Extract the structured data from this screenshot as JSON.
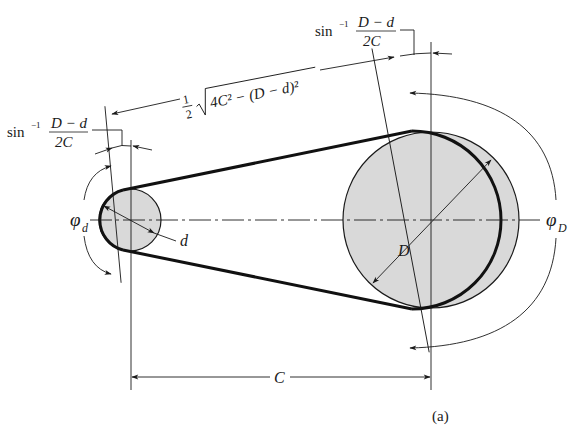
{
  "figure": {
    "caption": "(a)",
    "colors": {
      "line": "#1a1a1a",
      "pulley_fill": "#d9d9d9",
      "background": "#ffffff"
    }
  },
  "labels": {
    "sin_left_prefix": "sin",
    "sin_left_exp": "−1",
    "sin_left_num": "D − d",
    "sin_left_den": "2C",
    "sin_right_prefix": "sin",
    "sin_right_exp": "−1",
    "sin_right_num": "D − d",
    "sin_right_den": "2C",
    "span_half_num": "1",
    "span_half_den": "2",
    "span_radicand": "4C² − (D − d)²",
    "phi_small": "φ",
    "phi_small_sub": "d",
    "phi_large": "φ",
    "phi_large_sub": "D",
    "small_diameter": "d",
    "large_diameter": "D",
    "center_distance": "C"
  }
}
